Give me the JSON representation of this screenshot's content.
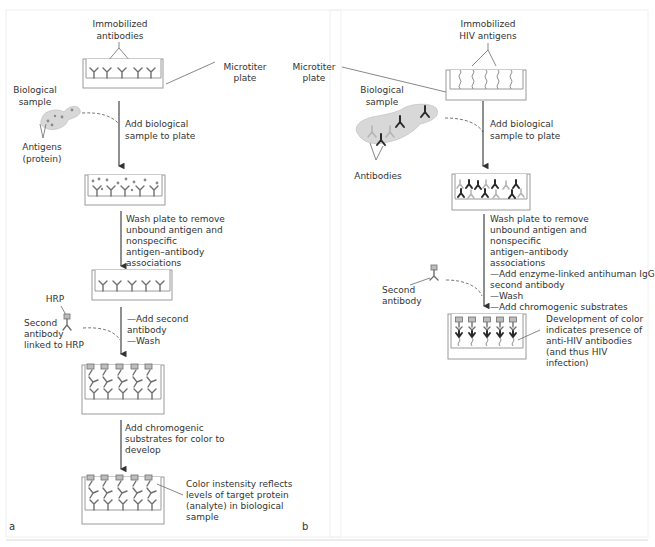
{
  "figure": {
    "panels": [
      {
        "id": "a",
        "label": "a",
        "top_label": [
          "Immobilized",
          "antibodies"
        ],
        "plate_label": [
          "Microtiter",
          "plate"
        ],
        "sample_label": [
          "Biological",
          "sample"
        ],
        "antigen_label": [
          "Antigens",
          "(protein)"
        ],
        "steps": [
          {
            "text": [
              "Add biological",
              "sample to plate"
            ]
          },
          {
            "text": [
              "Wash plate to remove",
              "unbound antigen and",
              "nonspecific",
              "antigen–antibody",
              "associations"
            ]
          },
          {
            "text": [
              "—Add second",
              "antibody",
              "—Wash"
            ]
          },
          {
            "text": [
              "Add chromogenic",
              "substrates for color to",
              "develop"
            ]
          }
        ],
        "hrp_label": "HRP",
        "second_antibody_label": [
          "Second",
          "antibody",
          "linked to HRP"
        ],
        "result_label": [
          "Color instensity reflects",
          "levels of target protein",
          "(analyte) in biological",
          "sample"
        ]
      },
      {
        "id": "b",
        "label": "b",
        "top_label": [
          "Immobilized",
          "HIV antigens"
        ],
        "plate_label": [
          "Microtiter",
          "plate"
        ],
        "sample_label": [
          "Biological",
          "sample"
        ],
        "antibodies_label": "Antibodies",
        "steps": [
          {
            "text": [
              "Add biological",
              "sample to plate"
            ]
          },
          {
            "text": [
              "Wash plate to remove",
              "unbound antigen and",
              "nonspecific",
              "antigen–antibody",
              "associations",
              "—Add enzyme-linked antihuman IgG",
              "second antibody",
              "—Wash",
              "—Add chromogenic substrates"
            ]
          }
        ],
        "second_antibody_label": [
          "Second",
          "antibody"
        ],
        "result_label": [
          "Development of color",
          "indicates presence of",
          "anti-HIV antibodies",
          "(and thus HIV",
          "infection)"
        ]
      }
    ]
  }
}
